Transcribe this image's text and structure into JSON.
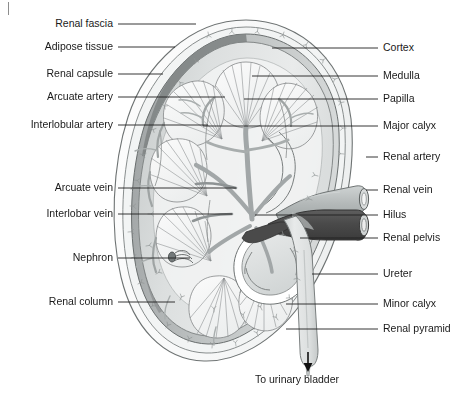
{
  "figure": {
    "corner_mark": "page-edge-tick"
  },
  "labels_left": [
    {
      "id": "renal-fascia",
      "text": "Renal fascia",
      "text_x": 113,
      "text_y": 18,
      "line_y": 24,
      "line_x1": 118,
      "line_x2": 196
    },
    {
      "id": "adipose-tissue",
      "text": "Adipose tissue",
      "text_x": 113,
      "text_y": 41,
      "line_y": 47,
      "line_x1": 118,
      "line_x2": 175
    },
    {
      "id": "renal-capsule",
      "text": "Renal capsule",
      "text_x": 113,
      "text_y": 68,
      "line_y": 74,
      "line_x1": 118,
      "line_x2": 163
    },
    {
      "id": "arcuate-artery",
      "text": "Arcuate artery",
      "text_x": 113,
      "text_y": 91,
      "line_y": 97,
      "line_x1": 118,
      "line_x2": 225
    },
    {
      "id": "interlobular-artery",
      "text": "Interlobular artery",
      "text_x": 113,
      "text_y": 119,
      "line_y": 125,
      "line_x1": 118,
      "line_x2": 208
    },
    {
      "id": "arcuate-vein",
      "text": "Arcuate vein",
      "text_x": 113,
      "text_y": 182,
      "line_y": 188,
      "line_x1": 118,
      "line_x2": 236
    },
    {
      "id": "interlobar-vein",
      "text": "Interlobar vein",
      "text_x": 113,
      "text_y": 208,
      "line_y": 214,
      "line_x1": 118,
      "line_x2": 232
    },
    {
      "id": "nephron",
      "text": "Nephron",
      "text_x": 113,
      "text_y": 252,
      "line_y": 258,
      "line_x1": 118,
      "line_x2": 190
    },
    {
      "id": "renal-column",
      "text": "Renal column",
      "text_x": 113,
      "text_y": 296,
      "line_y": 302,
      "line_x1": 118,
      "line_x2": 175
    }
  ],
  "labels_right": [
    {
      "id": "cortex",
      "text": "Cortex",
      "text_x": 383,
      "text_y": 42,
      "line_y": 48,
      "line_x1": 272,
      "line_x2": 378
    },
    {
      "id": "medulla",
      "text": "Medulla",
      "text_x": 383,
      "text_y": 70,
      "line_y": 76,
      "line_x1": 252,
      "line_x2": 378
    },
    {
      "id": "papilla",
      "text": "Papilla",
      "text_x": 383,
      "text_y": 93,
      "line_y": 99,
      "line_x1": 244,
      "line_x2": 378
    },
    {
      "id": "major-calyx",
      "text": "Major calyx",
      "text_x": 383,
      "text_y": 120,
      "line_y": 126,
      "line_x1": 203,
      "line_x2": 378
    },
    {
      "id": "renal-artery",
      "text": "Renal artery",
      "text_x": 383,
      "text_y": 151,
      "line_y": 157,
      "line_x1": 366,
      "line_x2": 378
    },
    {
      "id": "renal-vein",
      "text": "Renal vein",
      "text_x": 383,
      "text_y": 184,
      "line_y": 190,
      "line_x1": 366,
      "line_x2": 378
    },
    {
      "id": "hilus",
      "text": "Hilus",
      "text_x": 383,
      "text_y": 209,
      "line_y": 215,
      "line_x1": 255,
      "line_x2": 378
    },
    {
      "id": "renal-pelvis",
      "text": "Renal pelvis",
      "text_x": 383,
      "text_y": 232,
      "line_y": 238,
      "line_x1": 300,
      "line_x2": 378
    },
    {
      "id": "ureter",
      "text": "Ureter",
      "text_x": 383,
      "text_y": 268,
      "line_y": 274,
      "line_x1": 312,
      "line_x2": 378
    },
    {
      "id": "minor-calyx",
      "text": "Minor calyx",
      "text_x": 383,
      "text_y": 298,
      "line_y": 304,
      "line_x1": 286,
      "line_x2": 378
    },
    {
      "id": "renal-pyramid",
      "text": "Renal pyramid",
      "text_x": 383,
      "text_y": 323,
      "line_y": 329,
      "line_x1": 286,
      "line_x2": 378
    }
  ],
  "annotation": {
    "flow_arrow": "down-arrow",
    "flow_text": "To urinary  bladder",
    "flow_text_x": 255,
    "flow_text_y": 374
  },
  "caption": {
    "text": ""
  },
  "colors": {
    "outline": "#5a5a5a",
    "fat_fill": "#fbfbfb",
    "capsule_fill": "#b9bcbd",
    "cortex_fill": "#d9dcdc",
    "medulla_fill": "#f4f5f5",
    "pelvis_fill": "#e3e5e5",
    "artery_fill": "#b6bbbb",
    "vein_fill": "#4b4b4b",
    "ureter_fill": "#dfe2e2",
    "leader_line": "#202020",
    "text": "#1a1a1a"
  }
}
